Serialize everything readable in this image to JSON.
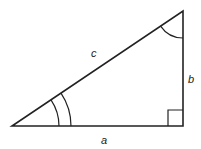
{
  "diagram": {
    "type": "right-triangle",
    "vertices": {
      "bottom_left": [
        12,
        126
      ],
      "right_angle": [
        183,
        126
      ],
      "top": [
        183,
        11
      ]
    },
    "sides": {
      "a": {
        "label": "a",
        "position": [
          103,
          141
        ]
      },
      "b": {
        "label": "b",
        "position": [
          188,
          79
        ]
      },
      "c": {
        "label": "c",
        "position": [
          92,
          56
        ]
      }
    },
    "angle_markers": {
      "bottom_left": {
        "arcs": 2,
        "radii": [
          47,
          59
        ]
      },
      "top": {
        "arcs": 1,
        "radius": 27
      },
      "right_angle": {
        "type": "square",
        "size": 15
      }
    },
    "colors": {
      "stroke": "#222222",
      "background": "#ffffff"
    }
  }
}
